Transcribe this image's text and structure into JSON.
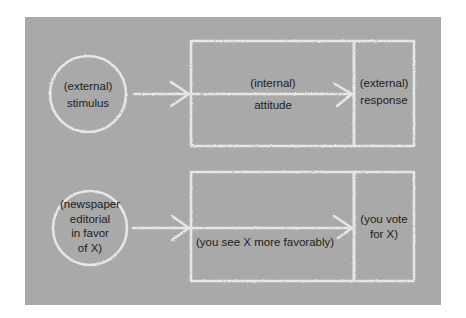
{
  "diagram": {
    "background_color": "#a9a9a9",
    "chalk_color": "#ececec",
    "text_color": "#1c1c1c",
    "rows": [
      {
        "id": "general-model",
        "stimulus": {
          "lines": [
            "(external)",
            "stimulus"
          ]
        },
        "attitude": {
          "line1": "(internal)",
          "line2": "attitude"
        },
        "response": {
          "lines": [
            "(external)",
            "response"
          ]
        }
      },
      {
        "id": "example",
        "stimulus": {
          "lines": [
            "(newspaper",
            "editorial",
            "in favor",
            "of X)"
          ]
        },
        "attitude": {
          "line1": "(you see X more favorably)"
        },
        "response": {
          "lines": [
            "(you vote",
            "for X)"
          ]
        }
      }
    ]
  }
}
